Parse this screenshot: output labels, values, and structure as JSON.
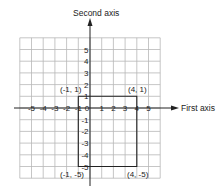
{
  "axes": {
    "x_label": "First axis",
    "y_label": "Second axis",
    "x_ticks": [
      "-5",
      "-4",
      "-3",
      "-2",
      "-1",
      "0",
      "1",
      "2",
      "3",
      "4",
      "5"
    ],
    "y_ticks": [
      "5",
      "4",
      "3",
      "2",
      "1",
      "-1",
      "-2",
      "-3",
      "-4",
      "-5"
    ]
  },
  "points": [
    {
      "label": "(-1, 1)",
      "x": -1,
      "y": 1
    },
    {
      "label": "(4, 1)",
      "x": 4,
      "y": 1
    },
    {
      "label": "(-1, -5)",
      "x": -1,
      "y": -5
    },
    {
      "label": "(4, -5)",
      "x": 4,
      "y": -5
    }
  ],
  "colors": {
    "grid": "#b8b8b8",
    "axis": "#222222",
    "rectangle": "#222222",
    "background": "#ffffff"
  },
  "chart_data": {
    "type": "scatter",
    "title": "",
    "xlabel": "First axis",
    "ylabel": "Second axis",
    "xlim": [
      -6,
      6
    ],
    "ylim": [
      -6,
      6
    ],
    "grid": true,
    "series": [
      {
        "name": "rectangle",
        "shape": "polygon",
        "x": [
          -1,
          4,
          4,
          -1,
          -1
        ],
        "y": [
          1,
          1,
          -5,
          -5,
          1
        ],
        "labels": [
          "(-1, 1)",
          "(4, 1)",
          "(4, -5)",
          "(-1, -5)"
        ]
      }
    ]
  }
}
